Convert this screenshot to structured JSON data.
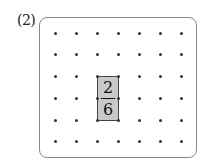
{
  "problem": {
    "label": "(2)"
  },
  "grid": {
    "columns": 7,
    "rows": 6,
    "dot_x": [
      55,
      76,
      97,
      118,
      139,
      160,
      181
    ],
    "dot_y": [
      33,
      54,
      76,
      98,
      120,
      141
    ],
    "dot_color": "#333333",
    "border_color": "#8a8a8a"
  },
  "shaded_rect": {
    "col_start": 2,
    "col_end": 3,
    "row_start": 2,
    "row_end": 4,
    "fill": "#c9c9c9",
    "fraction": {
      "numerator": "2",
      "denominator": "6"
    }
  }
}
